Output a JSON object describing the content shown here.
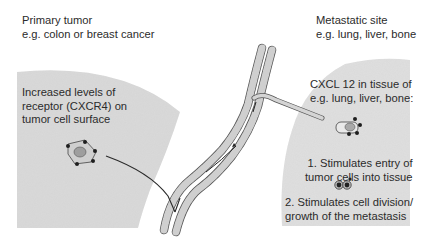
{
  "primary": {
    "title": "Primary tumor",
    "subtitle": "e.g. colon or breast cancer",
    "receptor_lines": [
      "Increased levels of",
      "receptor (CXCR4) on",
      "tumor cell surface"
    ]
  },
  "metastatic": {
    "title": "Metastatic site",
    "subtitle": "e.g. lung, liver, bone",
    "cxcl_lines": [
      "CXCL 12 in tissue of",
      "e.g. lung, liver, bone:"
    ],
    "step1_lines": [
      "1. Stimulates entry of",
      "tumor cells into tissue"
    ],
    "step2_lines": [
      "2. Stimulates cell division/",
      "growth of the metastasis"
    ]
  },
  "colors": {
    "tissue": "#dcdcdc",
    "vessel_wall": "#bdbdbd",
    "outline": "#3a3a3a",
    "receptor_dot": "#1e1e1e"
  }
}
